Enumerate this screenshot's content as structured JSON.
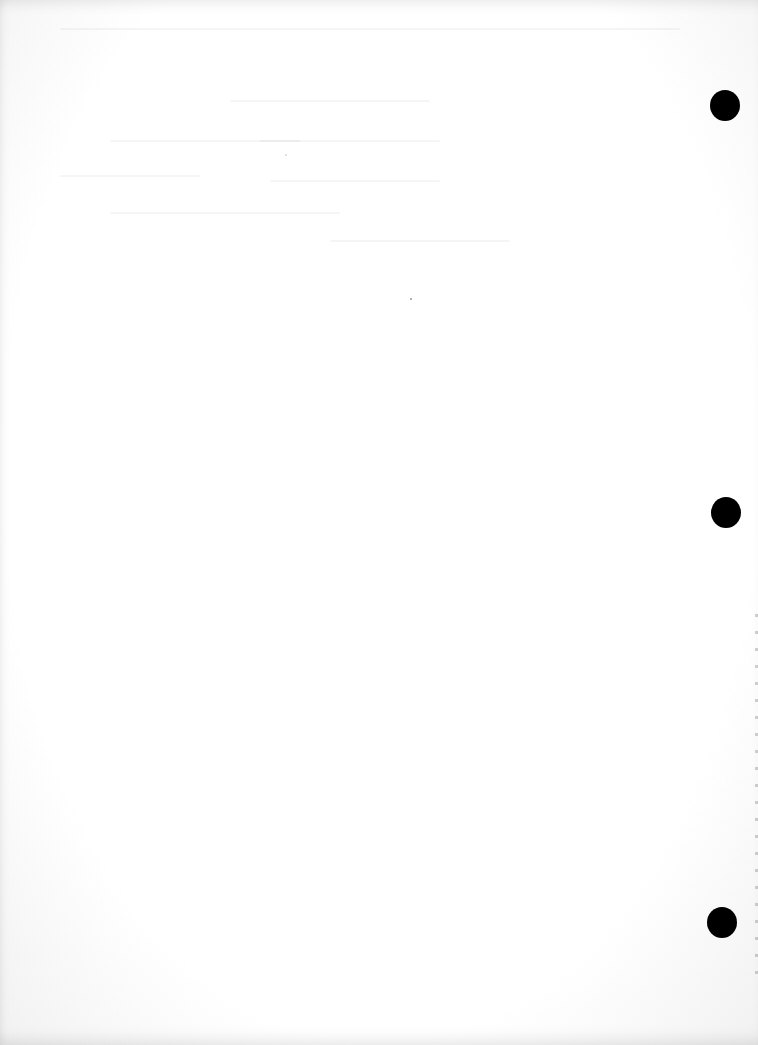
{
  "document": {
    "type": "scanned-page",
    "content_text": "",
    "background_color": "#ffffff",
    "hole_color": "#000000",
    "punch_holes": [
      {
        "cx": 725,
        "cy": 105,
        "diameter": 30
      },
      {
        "cx": 726,
        "cy": 512,
        "diameter": 30
      },
      {
        "cx": 722,
        "cy": 922,
        "diameter": 30
      }
    ]
  }
}
